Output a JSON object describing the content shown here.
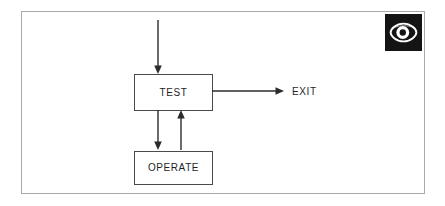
{
  "figure": {
    "kind": "flowchart",
    "background_color": "#ffffff",
    "frame_border_color": "#a9a9a9",
    "line_color": "#2b2b2b",
    "box_border_color": "#4a4a4a",
    "text_color": "#1f1f1f"
  },
  "nodes": [
    {
      "id": "test",
      "label": "TEST",
      "shape": "rectangle"
    },
    {
      "id": "operate",
      "label": "OPERATE",
      "shape": "rectangle"
    }
  ],
  "labels": [
    {
      "id": "exit",
      "text": "EXIT"
    }
  ],
  "edges": [
    {
      "id": "entry-to-test",
      "from": "",
      "to": "test",
      "direction": "down",
      "arrow": true
    },
    {
      "id": "test-to-exit",
      "from": "test",
      "to": "exit",
      "direction": "right",
      "arrow": true
    },
    {
      "id": "test-to-operate",
      "from": "test",
      "to": "operate",
      "direction": "down",
      "arrow": true
    },
    {
      "id": "operate-to-test",
      "from": "operate",
      "to": "test",
      "direction": "up",
      "arrow": true
    }
  ],
  "logo": {
    "name": "eye-logo",
    "background_color": "#141414",
    "mark_color": "#ffffff"
  }
}
